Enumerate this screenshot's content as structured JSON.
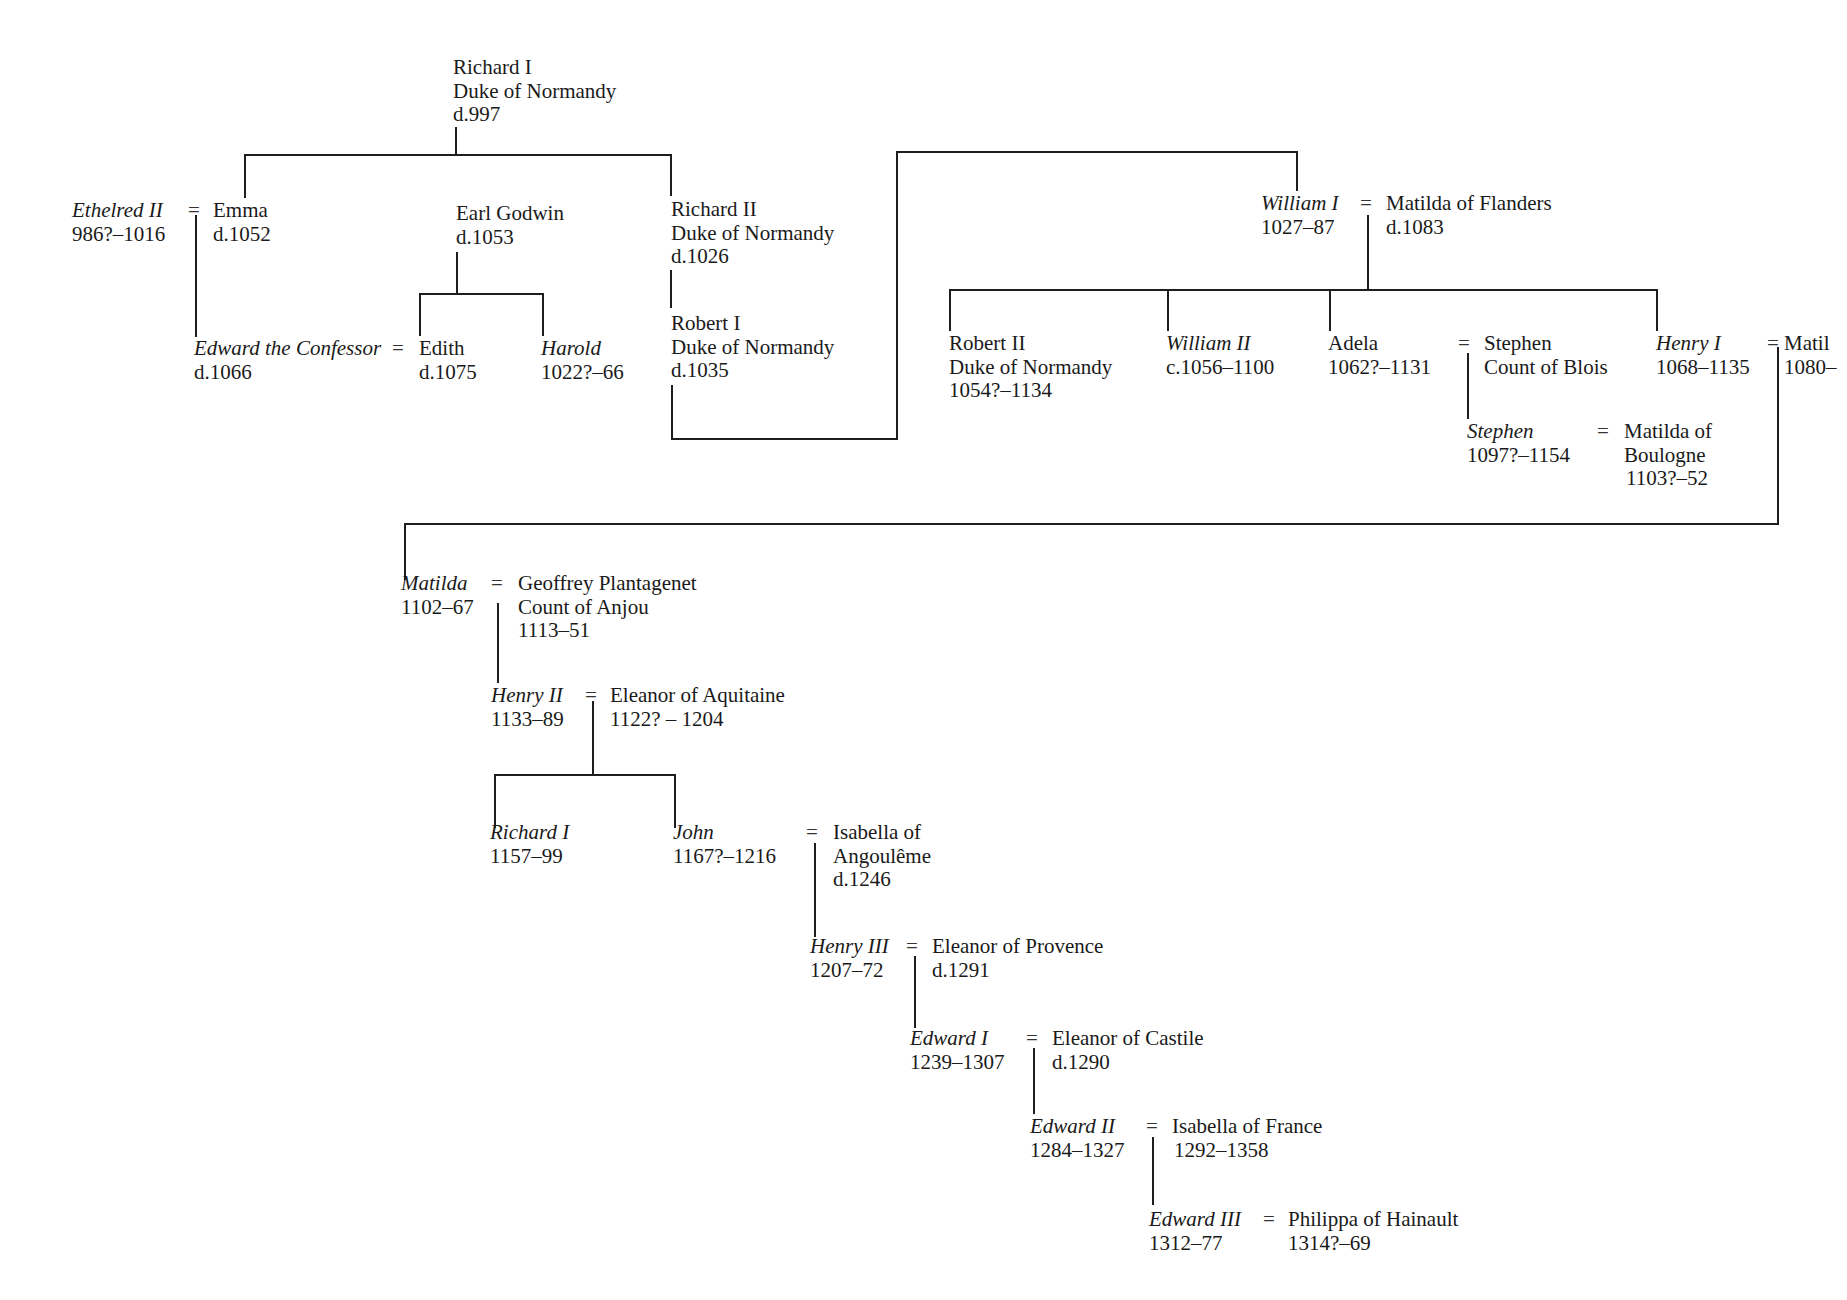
{
  "diagram": {
    "type": "family-tree",
    "title": "",
    "people": {
      "richard1_normandy": {
        "name": "Richard I",
        "title": "Duke of Normandy",
        "dates": "d.997"
      },
      "ethelred2": {
        "name": "Ethelred II",
        "dates": "986?–1016",
        "monarch": true
      },
      "emma": {
        "name": "Emma",
        "dates": "d.1052"
      },
      "earl_godwin": {
        "name": "Earl Godwin",
        "dates": "d.1053"
      },
      "richard2_normandy": {
        "name": "Richard II",
        "title": "Duke of Normandy",
        "dates": "d.1026"
      },
      "robert1_normandy": {
        "name": "Robert I",
        "title": "Duke of Normandy",
        "dates": "d.1035"
      },
      "edward_confessor": {
        "name": "Edward the Confessor",
        "dates": "d.1066",
        "monarch": true
      },
      "edith": {
        "name": "Edith",
        "dates": "d.1075"
      },
      "harold": {
        "name": "Harold",
        "dates": "1022?–66",
        "monarch": true
      },
      "william1": {
        "name": "William I",
        "dates": "1027–87",
        "monarch": true
      },
      "matilda_flanders": {
        "name": "Matilda of Flanders",
        "dates": "d.1083"
      },
      "robert2_normandy": {
        "name": "Robert II",
        "title": "Duke of Normandy",
        "dates": "1054?–1134"
      },
      "william2": {
        "name": "William II",
        "dates": "c.1056–1100",
        "monarch": true
      },
      "adela": {
        "name": "Adela",
        "dates": "1062?–1131"
      },
      "stephen_blois": {
        "name": "Stephen",
        "title": "Count of Blois"
      },
      "henry1": {
        "name": "Henry I",
        "dates": "1068–1135",
        "monarch": true
      },
      "matilda_henry1_wife": {
        "name": "Matil",
        "dates": "1080–"
      },
      "stephen_king": {
        "name": "Stephen",
        "dates": "1097?–1154",
        "monarch": true
      },
      "matilda_boulogne": {
        "name": "Matilda of",
        "title": "Boulogne",
        "dates": "1103?–52"
      },
      "empress_matilda": {
        "name": "Matilda",
        "dates": "1102–67",
        "monarch": true
      },
      "geoffrey_plantagenet": {
        "name": "Geoffrey Plantagenet",
        "title": "Count of Anjou",
        "dates": "1113–51"
      },
      "henry2": {
        "name": "Henry II",
        "dates": "1133–89",
        "monarch": true
      },
      "eleanor_aquitaine": {
        "name": "Eleanor of Aquitaine",
        "dates": "1122? – 1204"
      },
      "richard1_king": {
        "name": "Richard I",
        "dates": "1157–99",
        "monarch": true
      },
      "john": {
        "name": "John",
        "dates": "1167?–1216",
        "monarch": true
      },
      "isabella_angouleme": {
        "name": "Isabella of",
        "title": "Angoulême",
        "dates": "d.1246"
      },
      "henry3": {
        "name": "Henry III",
        "dates": "1207–72",
        "monarch": true
      },
      "eleanor_provence": {
        "name": "Eleanor of Provence",
        "dates": "d.1291"
      },
      "edward1": {
        "name": "Edward I",
        "dates": "1239–1307",
        "monarch": true
      },
      "eleanor_castile": {
        "name": "Eleanor of Castile",
        "dates": "d.1290"
      },
      "edward2": {
        "name": "Edward II",
        "dates": "1284–1327",
        "monarch": true
      },
      "isabella_france": {
        "name": "Isabella of France",
        "dates": "1292–1358"
      },
      "edward3": {
        "name": "Edward III",
        "dates": "1312–77",
        "monarch": true
      },
      "philippa_hainault": {
        "name": "Philippa of Hainault",
        "dates": "1314?–69"
      }
    },
    "marriage_symbol": "=",
    "marriages": [
      [
        "ethelred2",
        "emma"
      ],
      [
        "edward_confessor",
        "edith"
      ],
      [
        "william1",
        "matilda_flanders"
      ],
      [
        "adela",
        "stephen_blois"
      ],
      [
        "henry1",
        "matilda_henry1_wife"
      ],
      [
        "stephen_king",
        "matilda_boulogne"
      ],
      [
        "empress_matilda",
        "geoffrey_plantagenet"
      ],
      [
        "henry2",
        "eleanor_aquitaine"
      ],
      [
        "john",
        "isabella_angouleme"
      ],
      [
        "henry3",
        "eleanor_provence"
      ],
      [
        "edward1",
        "eleanor_castile"
      ],
      [
        "edward2",
        "isabella_france"
      ],
      [
        "edward3",
        "philippa_hainault"
      ]
    ],
    "descents": [
      {
        "parent": "richard1_normandy",
        "children": [
          "emma",
          "richard2_normandy"
        ]
      },
      {
        "parent": "ethelred2+emma",
        "children": [
          "edward_confessor"
        ]
      },
      {
        "parent": "earl_godwin",
        "children": [
          "edith",
          "harold"
        ]
      },
      {
        "parent": "richard2_normandy",
        "children": [
          "robert1_normandy"
        ]
      },
      {
        "parent": "robert1_normandy",
        "children": [
          "william1"
        ]
      },
      {
        "parent": "william1+matilda_flanders",
        "children": [
          "robert2_normandy",
          "william2",
          "adela",
          "henry1"
        ]
      },
      {
        "parent": "adela+stephen_blois",
        "children": [
          "stephen_king"
        ]
      },
      {
        "parent": "henry1+matilda_henry1_wife",
        "children": [
          "empress_matilda"
        ]
      },
      {
        "parent": "empress_matilda+geoffrey_plantagenet",
        "children": [
          "henry2"
        ]
      },
      {
        "parent": "henry2+eleanor_aquitaine",
        "children": [
          "richard1_king",
          "john"
        ]
      },
      {
        "parent": "john+isabella_angouleme",
        "children": [
          "henry3"
        ]
      },
      {
        "parent": "henry3+eleanor_provence",
        "children": [
          "edward1"
        ]
      },
      {
        "parent": "edward1+eleanor_castile",
        "children": [
          "edward2"
        ]
      },
      {
        "parent": "edward2+isabella_france",
        "children": [
          "edward3"
        ]
      }
    ]
  }
}
